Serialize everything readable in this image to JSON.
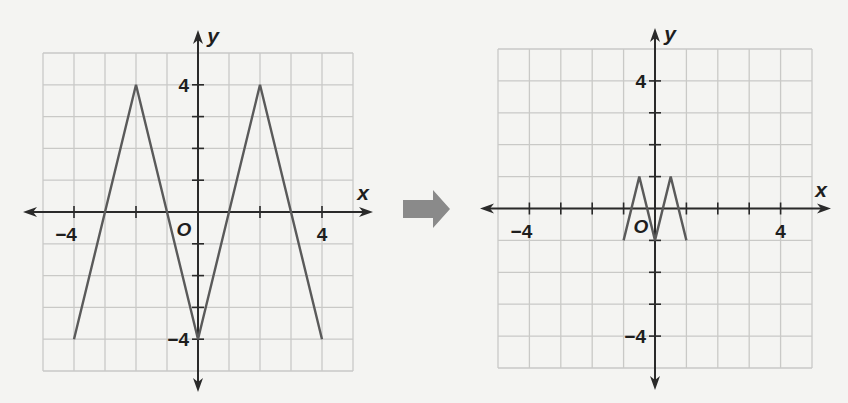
{
  "figure": {
    "arrow_color": "#8a8a8a",
    "transform_arrow": "right-arrow"
  },
  "chart_data": [
    {
      "type": "line",
      "title": "",
      "xlabel": "x",
      "ylabel": "y",
      "origin_label": "O",
      "xlim": [
        -5,
        5
      ],
      "ylim": [
        -5,
        5
      ],
      "grid": true,
      "grid_step": 1,
      "x_ticks": [
        -4,
        -2,
        2,
        4
      ],
      "y_ticks": [
        -4,
        -3,
        -2,
        -1,
        1,
        2,
        3,
        4
      ],
      "x_tick_labels": [
        {
          "value": -4,
          "label": "−4"
        },
        {
          "value": 4,
          "label": "4"
        }
      ],
      "y_tick_labels": [
        {
          "value": 4,
          "label": "4"
        },
        {
          "value": -4,
          "label": "−4"
        }
      ],
      "series": [
        {
          "name": "original zigzag",
          "color": "#5a5a5a",
          "x": [
            -4,
            -2,
            0,
            2,
            4
          ],
          "y": [
            -4,
            4,
            -4,
            4,
            -4
          ]
        }
      ],
      "layout": {
        "left": 43,
        "top": 53,
        "right": 353,
        "bottom": 371,
        "axis_x_min": 23,
        "axis_x_max": 373,
        "axis_y_min": 30,
        "axis_y_max": 392
      }
    },
    {
      "type": "line",
      "title": "",
      "xlabel": "x",
      "ylabel": "y",
      "origin_label": "O",
      "xlim": [
        -5,
        5
      ],
      "ylim": [
        -5,
        5
      ],
      "grid": true,
      "grid_step": 1,
      "x_ticks": [
        -4,
        -3,
        -2,
        -1,
        1,
        2,
        3,
        4
      ],
      "y_ticks": [
        -4,
        -3,
        -2,
        -1,
        1,
        2,
        3,
        4
      ],
      "x_tick_labels": [
        {
          "value": -4,
          "label": "−4"
        },
        {
          "value": 4,
          "label": "4"
        }
      ],
      "y_tick_labels": [
        {
          "value": 4,
          "label": "4"
        },
        {
          "value": -4,
          "label": "−4"
        }
      ],
      "series": [
        {
          "name": "transformed zigzag",
          "color": "#5a5a5a",
          "x": [
            -1,
            -0.5,
            0,
            0.5,
            1
          ],
          "y": [
            -1,
            1,
            -1,
            1,
            -1
          ]
        }
      ],
      "layout": {
        "left": 498,
        "top": 49,
        "right": 812,
        "bottom": 368,
        "axis_x_min": 480,
        "axis_x_max": 831,
        "axis_y_min": 28,
        "axis_y_max": 390
      }
    }
  ]
}
